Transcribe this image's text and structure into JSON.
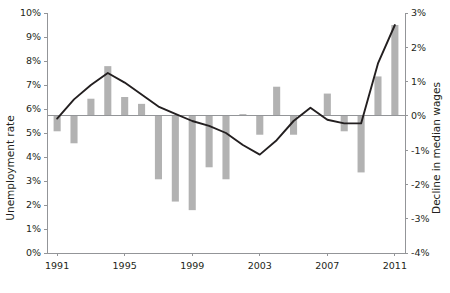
{
  "chart_data": {
    "type": "bar",
    "title": "",
    "subtitle": "",
    "xlabel": "",
    "ylabel": "Unemployment rate",
    "y2label": "Decline in median wages",
    "grid": false,
    "legend": false,
    "x": [
      1991,
      1992,
      1993,
      1994,
      1995,
      1996,
      1997,
      1998,
      1999,
      2000,
      2001,
      2002,
      2003,
      2004,
      2005,
      2006,
      2007,
      2008,
      2009,
      2010,
      2011
    ],
    "categories": [
      "1991",
      "1992",
      "1993",
      "1994",
      "1995",
      "1996",
      "1997",
      "1998",
      "1999",
      "2000",
      "2001",
      "2002",
      "2003",
      "2004",
      "2005",
      "2006",
      "2007",
      "2008",
      "2009",
      "2010",
      "2011"
    ],
    "xticks": [
      "1991",
      "1995",
      "1999",
      "2003",
      "2007",
      "2011"
    ],
    "xtick_values": [
      1991,
      1995,
      1999,
      2003,
      2007,
      2011
    ],
    "xlim": [
      1990.4,
      2011.6
    ],
    "yticks": [
      "0%",
      "1%",
      "2%",
      "3%",
      "4%",
      "5%",
      "6%",
      "7%",
      "8%",
      "9%",
      "10%"
    ],
    "ytick_values": [
      0,
      1,
      2,
      3,
      4,
      5,
      6,
      7,
      8,
      9,
      10
    ],
    "ylim": [
      0,
      10
    ],
    "y2ticks": [
      "-4%",
      "-3%",
      "-2%",
      "-1%",
      "0%",
      "1%",
      "2%",
      "3%"
    ],
    "y2tick_values": [
      -4,
      -3,
      -2,
      -1,
      0,
      1,
      2,
      3
    ],
    "y2lim": [
      -4,
      3
    ],
    "series": [
      {
        "name": "Decline in median wages",
        "render": "bar",
        "axis": "right",
        "color": "#b2b2b2",
        "values": [
          -0.45,
          -0.8,
          0.5,
          1.45,
          0.55,
          0.35,
          -1.85,
          -2.5,
          -2.75,
          -1.5,
          -1.85,
          0.05,
          -0.55,
          0.85,
          -0.55,
          0.0,
          0.65,
          -0.45,
          -1.65,
          1.15,
          2.65
        ]
      },
      {
        "name": "Unemployment rate",
        "render": "line",
        "axis": "left",
        "color": "#231f20",
        "values": [
          5.6,
          6.4,
          7.0,
          7.5,
          7.1,
          6.6,
          6.1,
          5.8,
          5.5,
          5.3,
          5.0,
          4.5,
          4.1,
          4.7,
          5.5,
          6.05,
          5.55,
          5.4,
          5.4,
          7.9,
          9.5
        ]
      }
    ]
  },
  "axes": {
    "left_title": "Unemployment rate",
    "right_title": "Decline in median wages"
  }
}
